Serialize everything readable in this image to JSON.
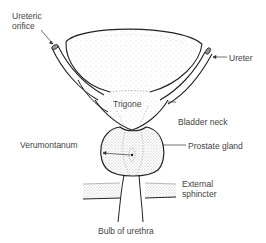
{
  "diagram": {
    "type": "anatomical-diagram",
    "labels": {
      "ureteric_orifice_line1": "Ureteric",
      "ureteric_orifice_line2": "orifice",
      "ureter": "Ureter",
      "trigone": "Trigone",
      "bladder_neck": "Bladder neck",
      "verumontanum": "Verumontanum",
      "prostate_gland": "Prostate gland",
      "external_sphincter_line1": "External",
      "external_sphincter_line2": "sphincter",
      "bulb_of_urethra": "Bulb of urethra"
    },
    "colors": {
      "line": "#222222",
      "stipple": "#bbbbbb",
      "text": "#444444"
    }
  }
}
